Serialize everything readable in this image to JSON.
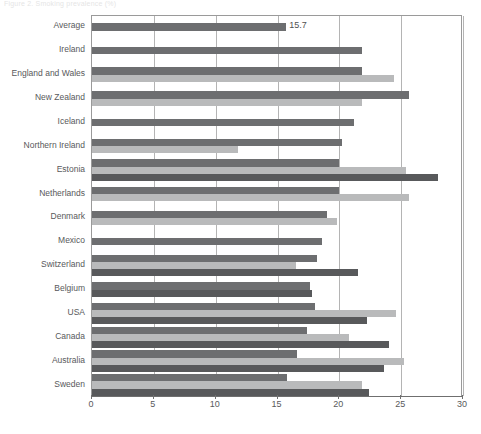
{
  "top_caption": "Figure 2. Smoking prevalence (%)",
  "chart_data": {
    "type": "bar",
    "orientation": "horizontal",
    "title": "",
    "xlabel": "",
    "ylabel": "",
    "xlim": [
      0,
      30
    ],
    "xticks": [
      0,
      5,
      10,
      15,
      20,
      25,
      30
    ],
    "xtick_labels": [
      "0",
      "5",
      "10",
      "15",
      "20",
      "25",
      "30"
    ],
    "grid": true,
    "legend": "none",
    "categories": [
      "Average",
      "Ireland",
      "England and Wales",
      "New Zealand",
      "Iceland",
      "Northern Ireland",
      "Estonia",
      "Netherlands",
      "Denmark",
      "Mexico",
      "Switzerland",
      "Belgium",
      "USA",
      "Canada",
      "Australia",
      "Sweden"
    ],
    "series": [
      {
        "name": "Series 1",
        "color": "#6d6e70",
        "values": [
          15.7,
          21.8,
          21.8,
          25.6,
          21.2,
          20.2,
          20.0,
          20.0,
          19.0,
          18.6,
          18.2,
          17.6,
          18.0,
          17.4,
          16.6,
          15.8
        ]
      },
      {
        "name": "Series 2",
        "color": "#b9babb",
        "values": [
          null,
          null,
          24.4,
          21.8,
          null,
          11.8,
          25.4,
          25.6,
          19.8,
          null,
          16.5,
          null,
          24.6,
          20.8,
          25.2,
          21.8
        ]
      },
      {
        "name": "Series 3",
        "color": "#58595b",
        "values": [
          null,
          null,
          null,
          null,
          null,
          null,
          28.0,
          null,
          null,
          null,
          21.5,
          17.8,
          22.2,
          24.0,
          23.6,
          22.4
        ]
      }
    ],
    "data_labels": [
      {
        "category": "Average",
        "value": "15.7"
      }
    ]
  },
  "colors": {
    "bar_dark": "#6d6e70",
    "bar_light": "#b9babb",
    "bar_accent": "#58595b",
    "grid": "#b4b4b4",
    "axis": "#6f6f6f",
    "text": "#58595b",
    "background": "#ffffff"
  }
}
